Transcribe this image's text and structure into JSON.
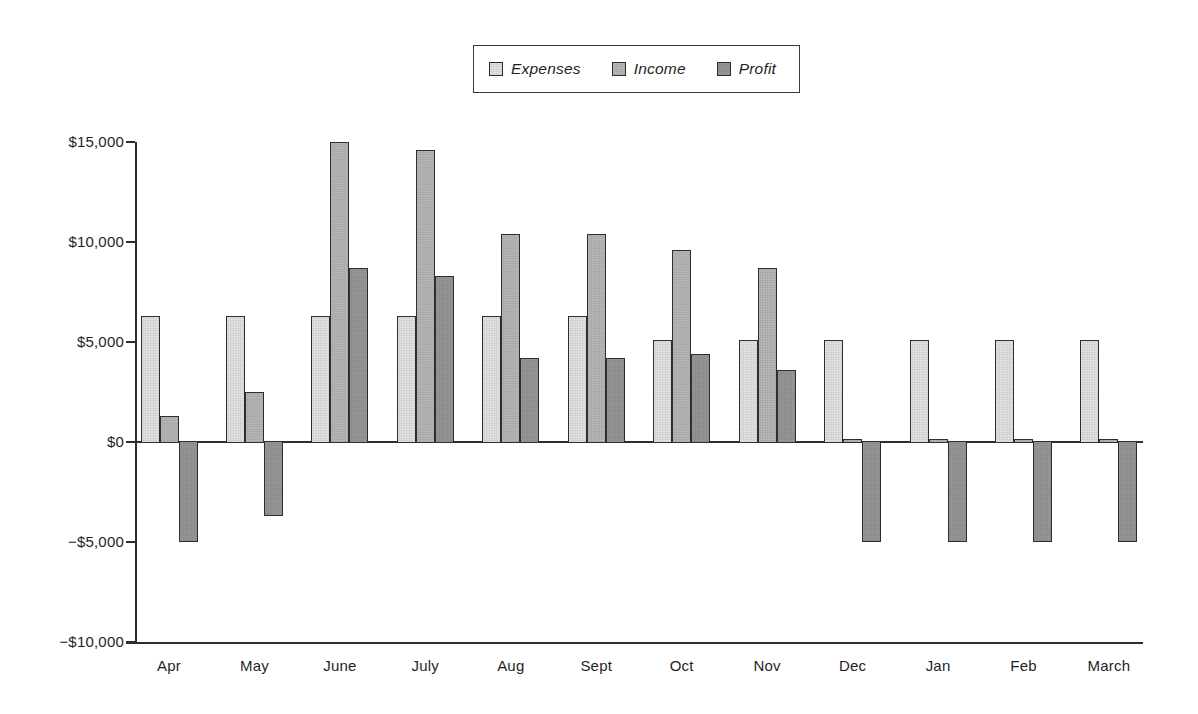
{
  "figure": {
    "background": "#ffffff",
    "text_color": "#1f1f1f"
  },
  "chart_data": {
    "type": "bar",
    "title": "",
    "xlabel": "",
    "ylabel": "",
    "categories": [
      "Apr",
      "May",
      "June",
      "July",
      "Aug",
      "Sept",
      "Oct",
      "Nov",
      "Dec",
      "Jan",
      "Feb",
      "March"
    ],
    "series": [
      {
        "name": "Expenses",
        "color": "#e2e2e2",
        "values": [
          6300,
          6300,
          6300,
          6300,
          6300,
          6300,
          5100,
          5100,
          5100,
          5100,
          5100,
          5100
        ]
      },
      {
        "name": "Income",
        "color": "#b6b6b6",
        "values": [
          1300,
          2500,
          15000,
          14600,
          10400,
          10400,
          9600,
          8700,
          150,
          150,
          150,
          150
        ]
      },
      {
        "name": "Profit",
        "color": "#969696",
        "values": [
          -5000,
          -3700,
          8700,
          8300,
          4200,
          4200,
          4400,
          3600,
          -5000,
          -5000,
          -5000,
          -5000
        ]
      }
    ],
    "ylim": [
      -10000,
      15000
    ],
    "ytick_step": 5000,
    "ytick_labels_top_to_bottom": [
      "$15,000",
      "$10,000",
      "$5,000",
      "$0",
      "−$5,000",
      "−$10,000"
    ],
    "grid": false,
    "legend_position": "top-center",
    "axis_color": "#2e2e2e",
    "bar_border_color": "#2e2e2e"
  }
}
